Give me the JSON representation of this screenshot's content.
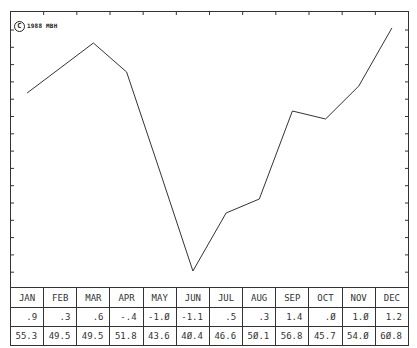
{
  "copyright": {
    "symbol": "C",
    "text": "1988 MBH"
  },
  "colors": {
    "line": "#333333",
    "frame": "#333333",
    "background": "#ffffff"
  },
  "table": {
    "months": [
      "JAN",
      "FEB",
      "MAR",
      "APR",
      "MAY",
      "JUN",
      "JUL",
      "AUG",
      "SEP",
      "OCT",
      "NOV",
      "DEC"
    ],
    "row1": [
      ".9",
      ".3",
      ".6",
      "-.4",
      "-1.Ø",
      "-1.1",
      ".5",
      ".3",
      "1.4",
      ".Ø",
      "1.Ø",
      "1.2"
    ],
    "row2": [
      "55.3",
      "49.5",
      "49.5",
      "51.8",
      "43.6",
      "4Ø.4",
      "46.6",
      "5Ø.1",
      "56.8",
      "45.7",
      "54.Ø",
      "6Ø.8"
    ]
  },
  "chart_data": {
    "type": "line",
    "title": "",
    "xlabel": "",
    "ylabel": "",
    "categories": [
      "JAN",
      "FEB",
      "MAR",
      "APR",
      "MAY",
      "JUN",
      "JUL",
      "AUG",
      "SEP",
      "OCT",
      "NOV",
      "DEC"
    ],
    "series": [
      {
        "name": "line (approx. plotted y-pixel, top=0)",
        "values": [
          93,
          68,
          43,
          72,
          171,
          271,
          213,
          199,
          111,
          119,
          86,
          28
        ]
      }
    ],
    "table_rows": [
      {
        "name": "row1",
        "values": [
          0.9,
          0.3,
          0.6,
          -0.4,
          -1.0,
          -1.1,
          0.5,
          0.3,
          1.4,
          0.0,
          1.0,
          1.2
        ]
      },
      {
        "name": "row2",
        "values": [
          55.3,
          49.5,
          49.5,
          51.8,
          43.6,
          40.4,
          46.6,
          50.1,
          56.8,
          45.7,
          54.0,
          60.8
        ]
      }
    ],
    "grid": false,
    "legend": "none",
    "annotations": [
      "© 1988 MBH"
    ]
  }
}
